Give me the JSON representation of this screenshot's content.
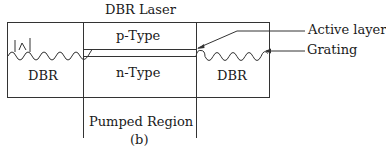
{
  "diagram": {
    "title": "DBR Laser",
    "regions": {
      "left": "DBR",
      "right": "DBR",
      "p_type": "p-Type",
      "n_type": "n-Type",
      "pumped": "Pumped Region"
    },
    "annotations": {
      "active_layer": "Active layer",
      "grating": "Grating"
    },
    "caption": "(b)"
  }
}
